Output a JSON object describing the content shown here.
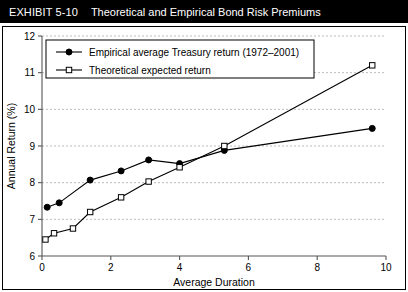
{
  "exhibit": {
    "number_label": "EXHIBIT 5-10",
    "title": "Theoretical and Empirical Bond Risk Premiums"
  },
  "chart_data": {
    "type": "line",
    "title": "Theoretical and Empirical Bond Risk Premiums",
    "xlabel": "Average Duration",
    "ylabel": "Annual Return (%)",
    "xlim": [
      0,
      10
    ],
    "ylim": [
      6,
      12
    ],
    "xticks": [
      "0",
      "2",
      "4",
      "6",
      "8",
      "10"
    ],
    "xtick_values": [
      0,
      2,
      4,
      6,
      8,
      10
    ],
    "yticks": [
      "6",
      "7",
      "8",
      "9",
      "10",
      "11",
      "12"
    ],
    "ytick_values": [
      6,
      7,
      8,
      9,
      10,
      11,
      12
    ],
    "grid": "horizontal-dashed",
    "legend_position": "top-left",
    "series": [
      {
        "name": "Empirical average Treasury return (1972–2001)",
        "marker": "filled-circle",
        "color": "#000000",
        "points": [
          [
            0.15,
            7.33
          ],
          [
            0.5,
            7.45
          ],
          [
            1.4,
            8.07
          ],
          [
            2.3,
            8.32
          ],
          [
            3.1,
            8.62
          ],
          [
            4.0,
            8.52
          ],
          [
            5.3,
            8.88
          ],
          [
            9.6,
            9.48
          ]
        ]
      },
      {
        "name": "Theoretical expected return",
        "marker": "open-square",
        "color": "#000000",
        "points": [
          [
            0.1,
            6.45
          ],
          [
            0.35,
            6.62
          ],
          [
            0.9,
            6.75
          ],
          [
            1.4,
            7.2
          ],
          [
            2.3,
            7.6
          ],
          [
            3.1,
            8.03
          ],
          [
            4.0,
            8.42
          ],
          [
            5.3,
            9.0
          ],
          [
            9.6,
            11.2
          ]
        ]
      }
    ]
  }
}
